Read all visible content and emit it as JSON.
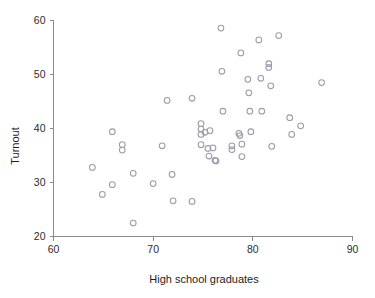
{
  "chart_data": {
    "type": "scatter",
    "title": "",
    "xlabel": "High school graduates",
    "ylabel": "Turnout",
    "xlim": [
      60,
      90
    ],
    "ylim": [
      20,
      60
    ],
    "xticks": [
      60,
      70,
      80,
      90
    ],
    "yticks": [
      20,
      30,
      40,
      50,
      60
    ],
    "xtick_labels": [
      "60",
      "70",
      "80",
      "90"
    ],
    "ytick_labels": [
      "20",
      "30",
      "40",
      "50",
      "60"
    ],
    "grid": false,
    "legend": null,
    "marker": "open-circle",
    "marker_color": "#9b9bab",
    "axis_color": "#8a8a8a",
    "n_points": 51,
    "points": [
      {
        "x": 63.9,
        "y": 32.8
      },
      {
        "x": 64.9,
        "y": 27.8
      },
      {
        "x": 65.9,
        "y": 39.4
      },
      {
        "x": 65.9,
        "y": 29.6
      },
      {
        "x": 66.9,
        "y": 37.0
      },
      {
        "x": 66.9,
        "y": 36.0
      },
      {
        "x": 68.0,
        "y": 31.7
      },
      {
        "x": 68.0,
        "y": 22.5
      },
      {
        "x": 70.0,
        "y": 29.8
      },
      {
        "x": 70.9,
        "y": 36.8
      },
      {
        "x": 71.4,
        "y": 45.2
      },
      {
        "x": 71.9,
        "y": 31.5
      },
      {
        "x": 72.0,
        "y": 26.6
      },
      {
        "x": 73.9,
        "y": 45.6
      },
      {
        "x": 73.9,
        "y": 26.5
      },
      {
        "x": 74.8,
        "y": 40.9
      },
      {
        "x": 74.8,
        "y": 39.9
      },
      {
        "x": 74.8,
        "y": 38.9
      },
      {
        "x": 74.8,
        "y": 37.0
      },
      {
        "x": 75.2,
        "y": 39.3
      },
      {
        "x": 75.5,
        "y": 36.3
      },
      {
        "x": 75.6,
        "y": 34.9
      },
      {
        "x": 75.7,
        "y": 39.6
      },
      {
        "x": 76.0,
        "y": 36.4
      },
      {
        "x": 76.2,
        "y": 34.1
      },
      {
        "x": 76.3,
        "y": 34.0
      },
      {
        "x": 76.8,
        "y": 58.6
      },
      {
        "x": 76.9,
        "y": 50.6
      },
      {
        "x": 77.0,
        "y": 43.2
      },
      {
        "x": 77.9,
        "y": 36.8
      },
      {
        "x": 77.9,
        "y": 36.1
      },
      {
        "x": 78.6,
        "y": 39.1
      },
      {
        "x": 78.7,
        "y": 38.7
      },
      {
        "x": 78.8,
        "y": 54.0
      },
      {
        "x": 78.9,
        "y": 37.1
      },
      {
        "x": 78.9,
        "y": 34.8
      },
      {
        "x": 79.5,
        "y": 49.1
      },
      {
        "x": 79.6,
        "y": 46.6
      },
      {
        "x": 79.7,
        "y": 43.2
      },
      {
        "x": 79.8,
        "y": 39.4
      },
      {
        "x": 80.6,
        "y": 56.4
      },
      {
        "x": 80.8,
        "y": 49.3
      },
      {
        "x": 80.9,
        "y": 43.2
      },
      {
        "x": 81.6,
        "y": 52.0
      },
      {
        "x": 81.6,
        "y": 51.3
      },
      {
        "x": 81.8,
        "y": 47.9
      },
      {
        "x": 81.9,
        "y": 36.7
      },
      {
        "x": 82.6,
        "y": 57.2
      },
      {
        "x": 83.7,
        "y": 42.0
      },
      {
        "x": 83.9,
        "y": 38.9
      },
      {
        "x": 84.8,
        "y": 40.5
      },
      {
        "x": 86.9,
        "y": 48.5
      }
    ]
  },
  "axes": {
    "y_title": "Turnout",
    "x_title": "High school graduates"
  }
}
